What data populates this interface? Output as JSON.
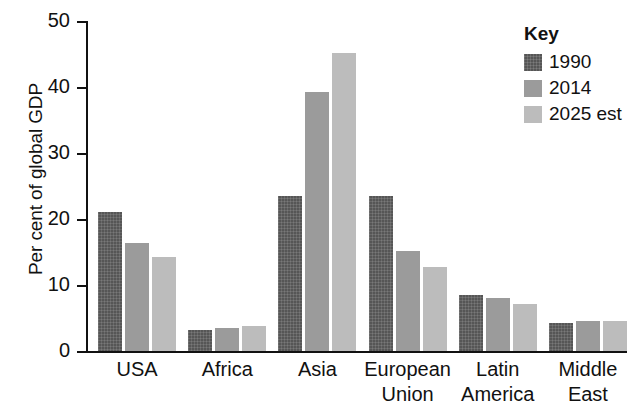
{
  "chart_data": {
    "type": "bar",
    "title": "",
    "xlabel": "",
    "ylabel": "Per cent of global GDP",
    "ylim": [
      0,
      50
    ],
    "yticks": [
      0,
      10,
      20,
      30,
      40,
      50
    ],
    "ytick_labels": [
      "0",
      "10",
      "20",
      "30",
      "40",
      "50"
    ],
    "grid": false,
    "legend_position": "top-right",
    "legend_title": "Key",
    "categories": [
      "USA",
      "Africa",
      "Asia",
      "European Union",
      "Latin America",
      "Middle East"
    ],
    "category_lines": [
      [
        "USA"
      ],
      [
        "Africa"
      ],
      [
        "Asia"
      ],
      [
        "European",
        "Union"
      ],
      [
        "Latin",
        "America"
      ],
      [
        "Middle",
        "East"
      ]
    ],
    "series": [
      {
        "name": "1990",
        "color": "#565656",
        "values": [
          21.0,
          3.2,
          23.5,
          23.5,
          8.5,
          4.2
        ]
      },
      {
        "name": "2014",
        "color": "#9b9b9b",
        "values": [
          16.3,
          3.5,
          39.2,
          15.1,
          8.0,
          4.5
        ]
      },
      {
        "name": "2025 est",
        "color": "#bcbcbc",
        "values": [
          14.2,
          3.8,
          45.1,
          12.7,
          7.1,
          4.5
        ]
      }
    ]
  }
}
